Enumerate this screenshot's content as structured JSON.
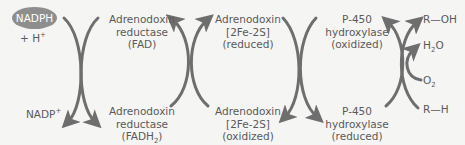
{
  "diagram": {
    "colors": {
      "arrow": "#6e6e6e",
      "text": "#5a5a5a",
      "ellipse": "#8e8e8e",
      "background": "#f5f5f4"
    },
    "inputs": {
      "nadph": "NADPH",
      "h_plus": "+ H",
      "h_plus_sup": "+",
      "nadp": "NADP",
      "nadp_sup": "+"
    },
    "top_row": [
      {
        "line1": "Adrenodoxin",
        "line2": "reductase",
        "line3": "(FAD)"
      },
      {
        "line1": "Adrenodoxin",
        "line2": "[2Fe-2S]",
        "line3": "(reduced)"
      },
      {
        "line1": "P-450",
        "line2": "hydroxylase",
        "line3": "(oxidized)"
      }
    ],
    "bottom_row": [
      {
        "line1": "Adrenodoxin",
        "line2": "reductase",
        "line3_pre": "(FADH",
        "line3_sub": "2",
        "line3_post": ")"
      },
      {
        "line1": "Adrenodoxin",
        "line2": "[2Fe-2S]",
        "line3": "(oxidized)"
      },
      {
        "line1": "P-450",
        "line2": "hydroxylase",
        "line3": "(reduced)"
      }
    ],
    "substrates": {
      "r_oh": "R—OH",
      "h2o_pre": "H",
      "h2o_sub": "2",
      "h2o_post": "O",
      "o2_pre": "O",
      "o2_sub": "2",
      "r_h": "R—H"
    }
  }
}
